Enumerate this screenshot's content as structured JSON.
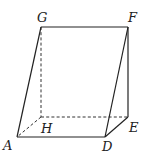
{
  "figure": {
    "type": "oblique triangular prism / wedge",
    "vertices": {
      "G": {
        "label": "G",
        "x": 41,
        "y": 27,
        "lx": 37,
        "ly": 22
      },
      "F": {
        "label": "F",
        "x": 128,
        "y": 27,
        "lx": 128,
        "ly": 22
      },
      "H": {
        "label": "H",
        "x": 41,
        "y": 117,
        "lx": 41,
        "ly": 133
      },
      "E": {
        "label": "E",
        "x": 128,
        "y": 117,
        "lx": 129,
        "ly": 132
      },
      "A": {
        "label": "A",
        "x": 17,
        "y": 137,
        "lx": 3,
        "ly": 150
      },
      "D": {
        "label": "D",
        "x": 105,
        "y": 137,
        "lx": 102,
        "ly": 151
      }
    },
    "solid_edges": [
      [
        "G",
        "F"
      ],
      [
        "F",
        "E"
      ],
      [
        "G",
        "A"
      ],
      [
        "A",
        "D"
      ],
      [
        "D",
        "E"
      ],
      [
        "D",
        "F"
      ]
    ],
    "dashed_edges": [
      [
        "G",
        "H"
      ],
      [
        "H",
        "E"
      ],
      [
        "H",
        "A"
      ]
    ]
  }
}
